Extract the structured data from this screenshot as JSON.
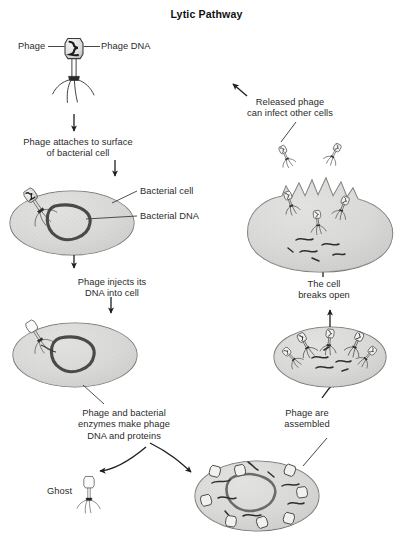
{
  "figure": {
    "title": "Lytic Pathway",
    "background_color": "#ffffff",
    "ink_color": "#2a2a2a",
    "cell_fill_color": "#d9d9d7",
    "dna_color": "#4a4a48"
  },
  "labels": {
    "phage": "Phage",
    "phage_dna": "Phage DNA",
    "attach": "Phage attaches to surface\nof bacterial cell",
    "bacterial_cell": "Bacterial cell",
    "bacterial_dna": "Bacterial DNA",
    "inject": "Phage injects its\nDNA into cell",
    "enzymes": "Phage and bacterial\nenzymes make phage\nDNA and proteins",
    "ghost": "Ghost",
    "assembled": "Phage are\nassembled",
    "breaks_open": "The cell\nbreaks open",
    "released": "Released phage\ncan infect other cells"
  },
  "stages": [
    {
      "id": "free-phage",
      "order": 1,
      "caption": "Phage",
      "side": "left"
    },
    {
      "id": "attachment",
      "order": 2,
      "caption": "Phage attaches to surface of bacterial cell",
      "side": "left"
    },
    {
      "id": "injection",
      "order": 3,
      "caption": "Phage injects its DNA into cell",
      "side": "left"
    },
    {
      "id": "biosynthesis",
      "order": 4,
      "caption": "Phage and bacterial enzymes make phage DNA and proteins",
      "side": "bottom"
    },
    {
      "id": "assembly",
      "order": 5,
      "caption": "Phage are assembled",
      "side": "right"
    },
    {
      "id": "lysis",
      "order": 6,
      "caption": "The cell breaks open",
      "side": "right"
    },
    {
      "id": "release",
      "order": 7,
      "caption": "Released phage can infect other cells",
      "side": "right"
    }
  ],
  "label_positions": {
    "phage": {
      "x": 18,
      "y": 41
    },
    "phage_dna": {
      "x": 93,
      "y": 41
    },
    "attach": {
      "x": 18,
      "y": 137
    },
    "bacterial_cell": {
      "x": 141,
      "y": 186
    },
    "bacterial_dna": {
      "x": 141,
      "y": 212
    },
    "inject": {
      "x": 44,
      "y": 277
    },
    "enzymes": {
      "x": 62,
      "y": 409
    },
    "ghost": {
      "x": 47,
      "y": 486
    },
    "assembled": {
      "x": 277,
      "y": 409
    },
    "breaks_open": {
      "x": 289,
      "y": 279
    },
    "released": {
      "x": 226,
      "y": 98
    }
  }
}
